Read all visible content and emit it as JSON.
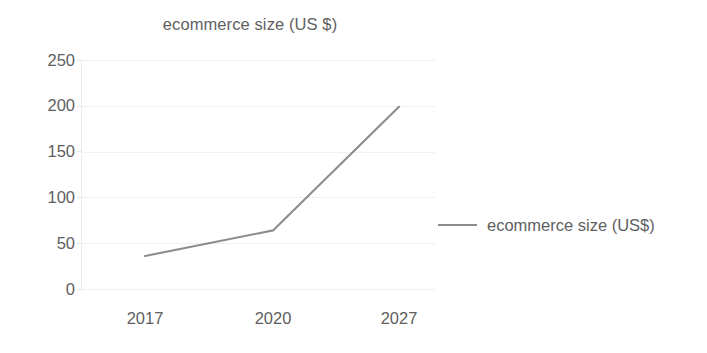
{
  "chart_data": {
    "type": "line",
    "title": "ecommerce size (US $)",
    "xlabel": "",
    "ylabel": "",
    "categories": [
      "2017",
      "2020",
      "2027"
    ],
    "series": [
      {
        "name": "ecommerce size (US$)",
        "values": [
          36,
          64,
          199
        ],
        "color": "#8c8c8c"
      }
    ],
    "ylim": [
      0,
      250
    ],
    "y_ticks": [
      "0",
      "50",
      "100",
      "150",
      "200",
      "250"
    ],
    "y_tick_values": [
      0,
      50,
      100,
      150,
      200,
      250
    ],
    "grid": true,
    "grid_axis": "y",
    "legend": true,
    "legend_position": "right",
    "markers": false
  },
  "legend": {
    "entries": [
      {
        "label": "ecommerce size (US$)",
        "marker": "line-marker",
        "color": "#8c8c8c"
      }
    ]
  },
  "colors": {
    "series": "#8c8c8c",
    "text": "#606060",
    "gridline": "#f1f1f1",
    "axis": "#ededed",
    "background": "#ffffff"
  }
}
